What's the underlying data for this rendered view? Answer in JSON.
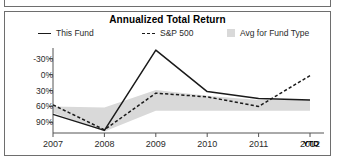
{
  "panel": {
    "title": "Annualized Total Return"
  },
  "legend": [
    {
      "label": "This Fund",
      "style": "solid",
      "color": "#1a1a1a"
    },
    {
      "label": "S&P 500",
      "style": "dashed",
      "color": "#1a1a1a"
    },
    {
      "label": "Avg for Fund Type",
      "style": "band",
      "color": "#d9d9d9"
    }
  ],
  "axis": {
    "y_ticks": [
      "90%",
      "60%",
      "30%",
      "0%",
      "-30%"
    ],
    "x_ticks": [
      "2007",
      "2008",
      "2009",
      "2010",
      "2011",
      "2012"
    ],
    "ytd_suffix": "YTD"
  },
  "chart_data": {
    "type": "line",
    "title": "Annualized Total Return",
    "xlabel": "",
    "ylabel": "",
    "categories": [
      "2007",
      "2008",
      "2009",
      "2010",
      "2011",
      "2012"
    ],
    "x_axis_note": "2012 value is YTD",
    "ylim": [
      -50,
      110
    ],
    "y_ticks": [
      -30,
      0,
      30,
      60,
      90
    ],
    "grid": false,
    "legend_position": "top",
    "series": [
      {
        "name": "This Fund",
        "style": "solid",
        "color": "#1a1a1a",
        "values": [
          -15,
          -45,
          106,
          28,
          15,
          12
        ]
      },
      {
        "name": "S&P 500",
        "style": "dashed",
        "color": "#1a1a1a",
        "values": [
          3,
          -44,
          25,
          18,
          0,
          58
        ]
      },
      {
        "name": "Avg for Fund Type",
        "style": "band",
        "color": "#d9d9d9",
        "band_upper": [
          0,
          -2,
          31,
          20,
          12,
          12
        ],
        "band_lower": [
          -12,
          -47,
          -8,
          -8,
          -8,
          -8
        ]
      }
    ]
  }
}
